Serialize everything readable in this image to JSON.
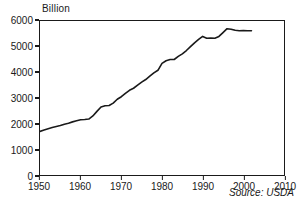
{
  "chart_data": {
    "type": "line",
    "title": "",
    "unit_label": "Billion",
    "xlabel": "",
    "ylabel": "",
    "xlim": [
      1950,
      2010
    ],
    "ylim": [
      0,
      6000
    ],
    "xticks": [
      1950,
      1960,
      1970,
      1980,
      1990,
      2000,
      2010
    ],
    "yticks": [
      0,
      1000,
      2000,
      3000,
      4000,
      5000,
      6000
    ],
    "grid": false,
    "legend": false,
    "annotations": [
      {
        "text": "Source: USDA",
        "position": "bottom-right",
        "style": "italic"
      }
    ],
    "line_color": "#1a1a1a",
    "line_width": 1.6,
    "x": [
      1950,
      1951,
      1952,
      1953,
      1954,
      1955,
      1956,
      1957,
      1958,
      1959,
      1960,
      1961,
      1962,
      1963,
      1964,
      1965,
      1966,
      1967,
      1968,
      1969,
      1970,
      1971,
      1972,
      1973,
      1974,
      1975,
      1976,
      1977,
      1978,
      1979,
      1980,
      1981,
      1982,
      1983,
      1984,
      1985,
      1986,
      1987,
      1988,
      1989,
      1990,
      1991,
      1992,
      1993,
      1994,
      1995,
      1996,
      1997,
      1998,
      1999,
      2000,
      2001,
      2002
    ],
    "values": [
      1700,
      1750,
      1800,
      1850,
      1890,
      1930,
      1980,
      2020,
      2070,
      2110,
      2150,
      2160,
      2180,
      2300,
      2480,
      2650,
      2700,
      2710,
      2800,
      2950,
      3050,
      3180,
      3300,
      3380,
      3500,
      3620,
      3720,
      3850,
      3980,
      4080,
      4350,
      4450,
      4500,
      4500,
      4620,
      4720,
      4850,
      5000,
      5150,
      5280,
      5400,
      5330,
      5340,
      5330,
      5400,
      5550,
      5700,
      5680,
      5640,
      5620,
      5630,
      5620,
      5620
    ]
  },
  "axes": {
    "y_tick_labels": [
      "6000",
      "5000",
      "4000",
      "3000",
      "2000",
      "1000",
      "0"
    ],
    "x_tick_labels": [
      "1950",
      "1960",
      "1970",
      "1980",
      "1990",
      "2000",
      "2010"
    ]
  },
  "source": {
    "text": "Source: USDA"
  },
  "labels": {
    "unit": "Billion"
  }
}
